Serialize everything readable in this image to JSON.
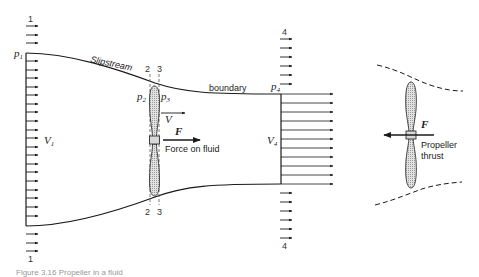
{
  "figure": {
    "caption": "Figure 3.16 Propeller in a fluid",
    "left_panel": {
      "station_labels": {
        "s1_top": "1",
        "s1_bottom": "1",
        "s2_top": "2",
        "s3_top": "3",
        "s2_bottom": "2",
        "s3_bottom": "3",
        "s4_top": "4",
        "s4_bottom": "4"
      },
      "pressure_labels": {
        "p1": "p",
        "p1_sub": "1",
        "p2": "p",
        "p2_sub": "2",
        "p3": "p",
        "p3_sub": "3",
        "p4": "p",
        "p4_sub": "4"
      },
      "velocity_labels": {
        "v1": "V",
        "v1_sub": "1",
        "v": "V",
        "v4": "V",
        "v4_sub": "4"
      },
      "force_label": "F",
      "force_text": "Force on fluid",
      "slipstream_text": "Slipstream",
      "boundary_text": "boundary"
    },
    "right_panel": {
      "force_label": "F",
      "thrust_text_line1": "Propeller",
      "thrust_text_line2": "thrust"
    },
    "colors": {
      "line": "#1a1a1a",
      "blade_fill": "#cfcfcf",
      "dashed": "#555555"
    }
  }
}
